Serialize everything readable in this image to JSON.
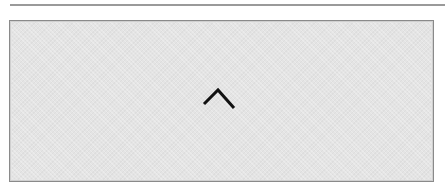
{
  "panel": {
    "icon": "chevron-up-icon",
    "background_color": "#e4e4e4",
    "border_color": "#8a8a8a"
  },
  "divider": {
    "color": "#9a9a9a"
  }
}
